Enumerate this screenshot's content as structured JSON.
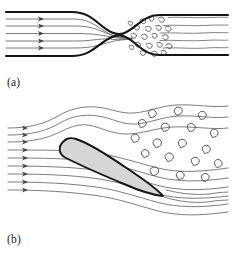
{
  "figure": {
    "type": "scientific-illustration",
    "background_color": "#ffffff"
  },
  "panels": [
    {
      "id": "a",
      "label": "(a)",
      "caption_text": "(a)",
      "description": "Flow through a constricted pipe: laminar streamlines upstream, turbulent eddies downstream of the throat",
      "elements": {
        "pipe_wall_color": "#1a1a1a",
        "streamline_color": "#6e6e6e",
        "turbulence_color": "#555555",
        "streamline_count": 5,
        "arrow_count": 5,
        "region_left_label": "laminar",
        "region_right_label": "turbulent"
      }
    },
    {
      "id": "b",
      "label": "(b)",
      "caption_text": "(b)",
      "description": "Flow past an inclined airfoil at high angle of attack with separated vortex wake",
      "elements": {
        "airfoil_fill_color": "#d6d6d6",
        "airfoil_outline_color": "#1a1a1a",
        "streamline_color": "#6e6e6e",
        "vortex_color": "#555555",
        "streamline_count": 9,
        "arrow_count": 9,
        "vortex_count": 18
      }
    }
  ],
  "colors": {
    "ink": "#1a1a1a",
    "stream": "#6e6e6e",
    "stream_light": "#8c8c8c",
    "eddy": "#555555",
    "airfoil_fill": "#d6d6d6",
    "paper": "#ffffff"
  }
}
